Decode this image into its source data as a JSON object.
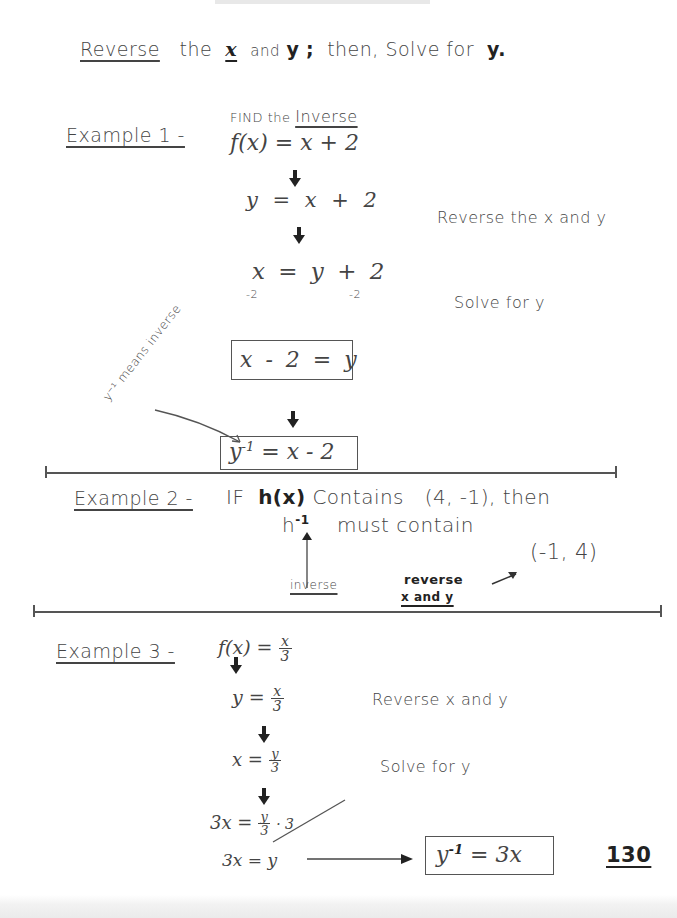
{
  "header": {
    "intro_word": "Reverse",
    "intro_rest_1": "the",
    "intro_x": "x",
    "intro_and": "and",
    "intro_y": "y",
    "intro_semicolon": ";",
    "intro_rest_2": "then, Solve for",
    "intro_y2": "y."
  },
  "example1": {
    "label": "Example 1 -",
    "subtitle_find": "FIND the",
    "subtitle_inverse": "Inverse",
    "step1": "f(x) = x + 2",
    "step2": "y = x + 2",
    "step2_note": "Reverse the x and y",
    "step3": "x = y + 2",
    "step3_sub_left": "-2",
    "step3_sub_right": "-2",
    "step3_note": "Solve for y",
    "boxed1": "x - 2 = y",
    "annotation": "y⁻¹ means inverse",
    "boxed2_lhs": "y",
    "boxed2_sup": "-1",
    "boxed2_rhs": " = x - 2"
  },
  "example2": {
    "label": "Example 2 -",
    "text_if": "IF",
    "func": "h(x)",
    "text_contains": "Contains",
    "point1": "(4, -1),",
    "text_then": "then",
    "hinv_base": "h",
    "hinv_sup": "-1",
    "text_must": "must contain",
    "point2": "(-1, 4)",
    "note_inverse": "inverse",
    "note_reverse": "reverse",
    "note_xy": "x and y"
  },
  "example3": {
    "label": "Example 3 -",
    "step1_lhs": "f(x) =",
    "step1_num": "x",
    "step1_den": "3",
    "step2_lhs": "y =",
    "step2_num": "x",
    "step2_den": "3",
    "step2_note": "Reverse x and y",
    "step3_lhs": "x =",
    "step3_num": "y",
    "step3_den": "3",
    "step3_note": "Solve for y",
    "step4_lhs": "3x =",
    "step4_num": "y",
    "step4_den": "3",
    "step4_mult": "· 3",
    "step5": "3x = y",
    "result_lhs": "y",
    "result_sup": "-1",
    "result_rhs": " = 3x"
  },
  "page_number": "130"
}
